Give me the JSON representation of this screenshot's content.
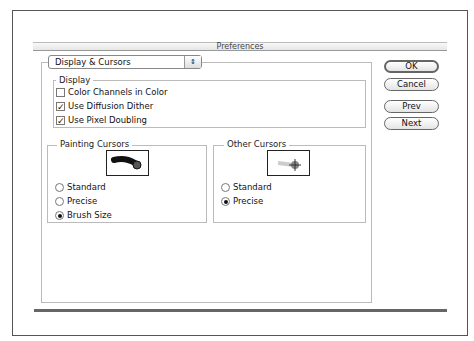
{
  "window": {
    "title": "Preferences"
  },
  "section_popup": {
    "value": "Display & Cursors",
    "icon": "updown-arrows-icon"
  },
  "display": {
    "label": "Display",
    "options": [
      {
        "label": "Color Channels in Color",
        "checked": false
      },
      {
        "label": "Use Diffusion Dither",
        "checked": true
      },
      {
        "label": "Use Pixel Doubling",
        "checked": true
      }
    ]
  },
  "painting": {
    "label": "Painting Cursors",
    "options": [
      {
        "label": "Standard",
        "selected": false
      },
      {
        "label": "Precise",
        "selected": false
      },
      {
        "label": "Brush Size",
        "selected": true
      }
    ]
  },
  "other": {
    "label": "Other Cursors",
    "options": [
      {
        "label": "Standard",
        "selected": false
      },
      {
        "label": "Precise",
        "selected": true
      }
    ]
  },
  "buttons": {
    "ok": "OK",
    "cancel": "Cancel",
    "prev": "Prev",
    "next": "Next"
  },
  "check_glyph": "✓"
}
